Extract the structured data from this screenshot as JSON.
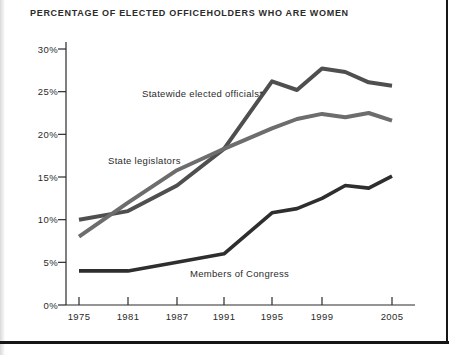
{
  "title": "PERCENTAGE OF ELECTED OFFICEHOLDERS WHO ARE WOMEN",
  "colors": {
    "background": "#ffffff",
    "axis": "#2b2b2b",
    "frame_rule": "#161616",
    "title_text": "#2b2b2b"
  },
  "chart_data": {
    "type": "line",
    "title": "PERCENTAGE OF ELECTED OFFICEHOLDERS WHO ARE WOMEN",
    "xlabel": "",
    "ylabel": "",
    "ylim": [
      0,
      30
    ],
    "grid": false,
    "legend": "inline-annotations",
    "x_axis": {
      "tick_labels": [
        "1975",
        "1981",
        "1987",
        "1991",
        "1995",
        "1999",
        "2005"
      ],
      "tick_years": [
        1975,
        1981,
        1987,
        1991,
        1995,
        1999,
        2005
      ],
      "tick_pixel_x": [
        79,
        128,
        177,
        224,
        272,
        322,
        392
      ]
    },
    "y_axis": {
      "tick_labels": [
        "0%",
        "5%",
        "10%",
        "15%",
        "20%",
        "25%",
        "30%"
      ],
      "tick_values": [
        0,
        5,
        10,
        15,
        20,
        25,
        30
      ]
    },
    "series": [
      {
        "name": "Statewide elected officials*",
        "color": "#4f4f4f",
        "stroke_width": 4,
        "points": [
          [
            1975,
            10
          ],
          [
            1981,
            11
          ],
          [
            1987,
            14
          ],
          [
            1991,
            18.3
          ],
          [
            1995,
            26.2
          ],
          [
            1997,
            25.2
          ],
          [
            1999,
            27.7
          ],
          [
            2001,
            27.3
          ],
          [
            2003,
            26.1
          ],
          [
            2005,
            25.7
          ]
        ]
      },
      {
        "name": "State legislators",
        "color": "#6d6d6d",
        "stroke_width": 4,
        "points": [
          [
            1975,
            8
          ],
          [
            1981,
            12
          ],
          [
            1987,
            15.8
          ],
          [
            1991,
            18.3
          ],
          [
            1995,
            20.7
          ],
          [
            1997,
            21.8
          ],
          [
            1999,
            22.4
          ],
          [
            2001,
            22.0
          ],
          [
            2003,
            22.5
          ],
          [
            2005,
            21.6
          ]
        ]
      },
      {
        "name": "Members of Congress",
        "color": "#2e2e2e",
        "stroke_width": 3.6,
        "points": [
          [
            1975,
            4
          ],
          [
            1981,
            4
          ],
          [
            1987,
            5
          ],
          [
            1991,
            6
          ],
          [
            1995,
            10.8
          ],
          [
            1997,
            11.3
          ],
          [
            1999,
            12.5
          ],
          [
            2001,
            14.0
          ],
          [
            2003,
            13.7
          ],
          [
            2005,
            15.1
          ]
        ]
      }
    ],
    "annotations": [
      {
        "text": "Statewide elected officials*",
        "px": 142,
        "py": 97
      },
      {
        "text": "State legislators",
        "px": 108,
        "py": 164
      },
      {
        "text": "Members of Congress",
        "px": 190,
        "py": 277
      }
    ],
    "layout": {
      "svg_width": 462,
      "svg_height": 355,
      "plot_left": 66,
      "plot_top": 42,
      "plot_bottom": 305,
      "plot_right": 415,
      "pixels_per_unit": 8.5333,
      "y_tick_len": 8,
      "x_tick_len": 8,
      "x_label_baseline": 320,
      "y_label_right": 58
    }
  }
}
